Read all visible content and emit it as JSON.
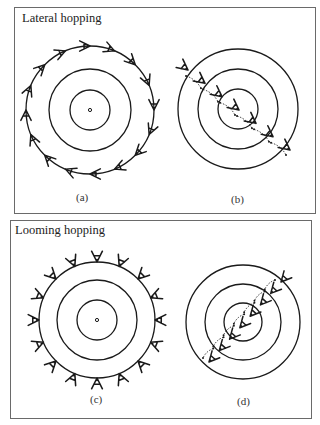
{
  "panels": [
    {
      "title": "Lateral hopping",
      "subfigures": [
        {
          "label": "(a)",
          "description": "Ring of observers hopping tangentially around concentric circles"
        },
        {
          "label": "(b)",
          "description": "Observers hopping laterally along a diagonal line across concentric circles"
        }
      ]
    },
    {
      "title": "Looming hopping",
      "subfigures": [
        {
          "label": "(c)",
          "description": "Ring of observers facing outward around concentric circles"
        },
        {
          "label": "(d)",
          "description": "Observers hopping along a diagonal line toward the center of concentric circles"
        }
      ]
    }
  ],
  "geometry": {
    "a": {
      "cx": 90,
      "cy": 110,
      "radii": [
        20,
        41,
        64
      ],
      "glyph_count": 16
    },
    "b": {
      "cx": 238,
      "cy": 109,
      "radii": [
        20,
        40,
        60
      ],
      "glyph_count": 7
    },
    "c": {
      "cx": 97,
      "cy": 320,
      "radii": [
        20,
        40,
        58
      ],
      "glyph_count": 16
    },
    "d": {
      "cx": 243,
      "cy": 322,
      "radii": [
        19,
        38,
        57
      ],
      "glyph_count": 8
    }
  },
  "colors": {
    "stroke": "#1a1a1a",
    "border": "#6a6a6a"
  }
}
